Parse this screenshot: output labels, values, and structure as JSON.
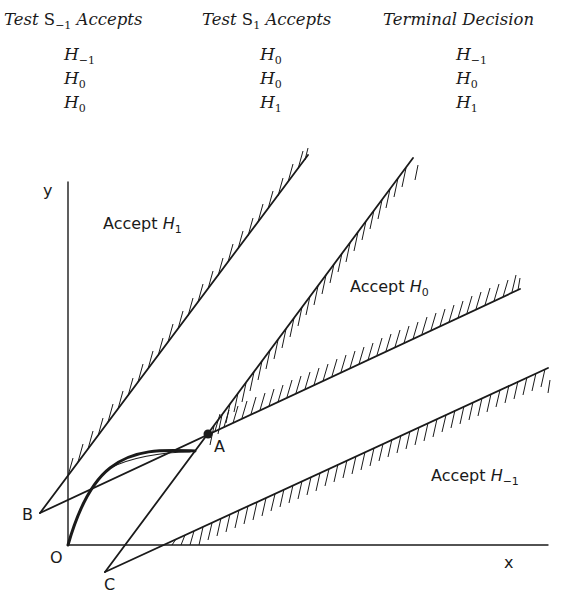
{
  "table": {
    "headers": [
      {
        "prefix": "Test ",
        "symbol": "S",
        "subscript": "−1",
        "suffix": " Accepts"
      },
      {
        "prefix": "Test ",
        "symbol": "S",
        "subscript": "1",
        "suffix": " Accepts"
      },
      {
        "prefix": "Terminal Decision",
        "symbol": "",
        "subscript": "",
        "suffix": ""
      }
    ],
    "rows": [
      [
        {
          "symbol": "H",
          "subscript": "−1"
        },
        {
          "symbol": "H",
          "subscript": "0"
        },
        {
          "symbol": "H",
          "subscript": "−1"
        }
      ],
      [
        {
          "symbol": "H",
          "subscript": "0"
        },
        {
          "symbol": "H",
          "subscript": "0"
        },
        {
          "symbol": "H",
          "subscript": "0"
        }
      ],
      [
        {
          "symbol": "H",
          "subscript": "0"
        },
        {
          "symbol": "H",
          "subscript": "1"
        },
        {
          "symbol": "H",
          "subscript": "1"
        }
      ]
    ]
  },
  "diagram": {
    "axes": {
      "x_label": "x",
      "y_label": "y"
    },
    "points": {
      "origin": "O",
      "A": "A",
      "B": "B",
      "C": "C"
    },
    "regions": [
      {
        "prefix": "Accept ",
        "symbol": "H",
        "subscript": "1"
      },
      {
        "prefix": "Accept ",
        "symbol": "H",
        "subscript": "0"
      },
      {
        "prefix": "Accept ",
        "symbol": "H",
        "subscript": "−1"
      }
    ],
    "colors": {
      "ink": "#1a1a1a",
      "background": "#ffffff"
    }
  }
}
